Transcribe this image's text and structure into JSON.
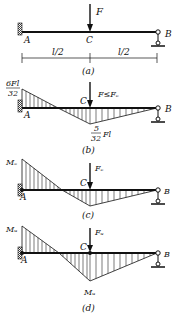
{
  "panels": [
    {
      "id": "a",
      "caption": "(a)",
      "load": "F",
      "point_a": "A",
      "point_b": "B",
      "point_c": "C",
      "dim_left": "l/2",
      "dim_right": "l/2"
    },
    {
      "id": "b",
      "caption": "(b)",
      "load": "F≤Fₑ",
      "point_a": "A",
      "point_b": "B",
      "point_c": "C",
      "moment_a_num": "6Fl",
      "moment_a_den": "32",
      "moment_c_num": "5",
      "moment_c_den": "32",
      "moment_c_suffix": "Fl"
    },
    {
      "id": "c",
      "caption": "(c)",
      "load": "Fₑ",
      "point_a": "A",
      "point_b": "B",
      "point_c": "C",
      "moment_a": "Mₑ"
    },
    {
      "id": "d",
      "caption": "(d)",
      "load": "Fᵤ",
      "point_a": "A",
      "point_b": "B",
      "point_c": "C",
      "moment_a": "Mᵤ",
      "moment_c": "Mᵤ"
    }
  ],
  "colors": {
    "line": "#111111",
    "hatch": "#222222"
  }
}
